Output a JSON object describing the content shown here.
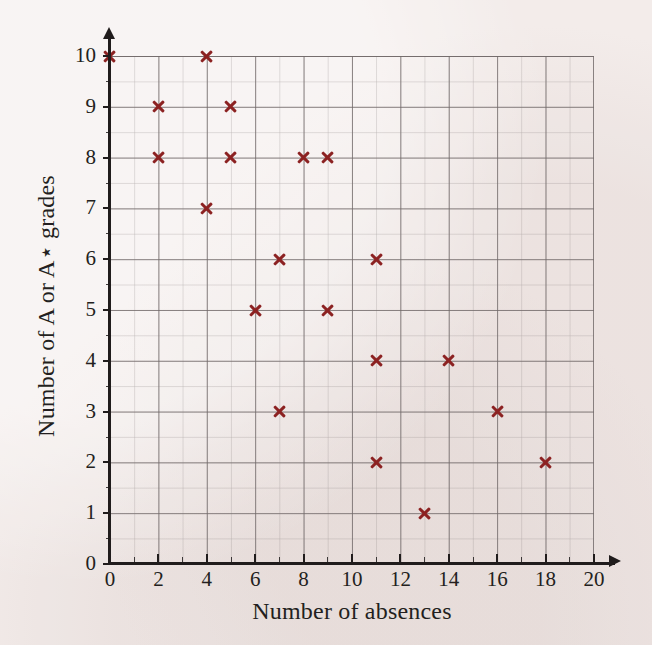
{
  "chart_data": {
    "type": "scatter",
    "title": "",
    "xlabel": "Number of absences",
    "ylabel": "Number of A or A⋆ grades",
    "xlim": [
      0,
      20
    ],
    "ylim": [
      0,
      10
    ],
    "x_major_step": 2,
    "x_minor_step": 1,
    "y_major_step": 1,
    "y_minor_step": 0.5,
    "grid": true,
    "legend": "none",
    "marker": "x",
    "marker_color": "#8c2222",
    "x_tick_labels": [
      "0",
      "2",
      "4",
      "6",
      "8",
      "10",
      "12",
      "14",
      "16",
      "18",
      "20"
    ],
    "x_tick_values": [
      0,
      2,
      4,
      6,
      8,
      10,
      12,
      14,
      16,
      18,
      20
    ],
    "x_minor_tick_values": [
      1,
      3,
      5,
      7,
      9,
      11,
      13,
      15,
      17,
      19
    ],
    "y_tick_labels": [
      "0",
      "1",
      "2",
      "3",
      "4",
      "5",
      "6",
      "7",
      "8",
      "9",
      "10"
    ],
    "y_tick_values": [
      0,
      1,
      2,
      3,
      4,
      5,
      6,
      7,
      8,
      9,
      10
    ],
    "y_minor_tick_values": [
      0.5,
      1.5,
      2.5,
      3.5,
      4.5,
      5.5,
      6.5,
      7.5,
      8.5,
      9.5
    ],
    "points": [
      {
        "x": 0,
        "y": 10
      },
      {
        "x": 4,
        "y": 10
      },
      {
        "x": 2,
        "y": 9
      },
      {
        "x": 5,
        "y": 9
      },
      {
        "x": 2,
        "y": 8
      },
      {
        "x": 5,
        "y": 8
      },
      {
        "x": 8,
        "y": 8
      },
      {
        "x": 9,
        "y": 8
      },
      {
        "x": 4,
        "y": 7
      },
      {
        "x": 7,
        "y": 6
      },
      {
        "x": 11,
        "y": 6
      },
      {
        "x": 6,
        "y": 5
      },
      {
        "x": 9,
        "y": 5
      },
      {
        "x": 11,
        "y": 4
      },
      {
        "x": 14,
        "y": 4
      },
      {
        "x": 7,
        "y": 3
      },
      {
        "x": 16,
        "y": 3
      },
      {
        "x": 11,
        "y": 2
      },
      {
        "x": 18,
        "y": 2
      },
      {
        "x": 13,
        "y": 1
      }
    ],
    "point_count": 20
  },
  "colors": {
    "background": "#f3ecea",
    "axis": "#201c1c",
    "grid_major": "#706868",
    "grid_minor": "#807878",
    "marker": "#8c2222",
    "text": "#231f20"
  }
}
